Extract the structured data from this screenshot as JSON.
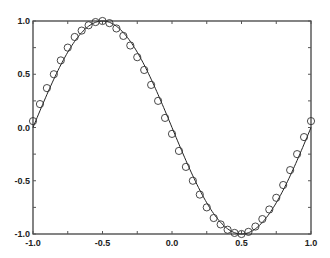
{
  "chart_data": {
    "type": "line",
    "title": "",
    "xlabel": "",
    "ylabel": "",
    "xlim": [
      -1.0,
      1.0
    ],
    "ylim": [
      -1.0,
      1.0
    ],
    "grid": false,
    "legend": null,
    "x_ticks": [
      "-1.0",
      "-0.5",
      "0.0",
      "0.5",
      "1.0"
    ],
    "y_ticks": [
      "1.0",
      "0.5",
      "0.0",
      "-0.5",
      "-1.0"
    ],
    "series": [
      {
        "name": "curve",
        "style": "solid line",
        "function": "y = -sin(pi*x)",
        "x": [
          -1.0,
          -0.9,
          -0.8,
          -0.7,
          -0.6,
          -0.5,
          -0.4,
          -0.3,
          -0.2,
          -0.1,
          0.0,
          0.1,
          0.2,
          0.3,
          0.4,
          0.5,
          0.6,
          0.7,
          0.8,
          0.9,
          1.0
        ],
        "values": [
          0.0,
          0.31,
          0.59,
          0.81,
          0.95,
          1.0,
          0.95,
          0.81,
          0.59,
          0.31,
          0.0,
          -0.31,
          -0.59,
          -0.81,
          -0.95,
          -1.0,
          -0.95,
          -0.81,
          -0.59,
          -0.31,
          0.0
        ]
      },
      {
        "name": "samples",
        "style": "open circles",
        "x": [
          -1.0,
          -0.95,
          -0.9,
          -0.85,
          -0.8,
          -0.75,
          -0.7,
          -0.65,
          -0.6,
          -0.55,
          -0.5,
          -0.45,
          -0.4,
          -0.35,
          -0.3,
          -0.25,
          -0.2,
          -0.15,
          -0.1,
          -0.05,
          0.0,
          0.05,
          0.1,
          0.15,
          0.2,
          0.25,
          0.3,
          0.35,
          0.4,
          0.45,
          0.5,
          0.55,
          0.6,
          0.65,
          0.7,
          0.75,
          0.8,
          0.85,
          0.9,
          0.95,
          1.0
        ],
        "values": [
          0.06,
          0.22,
          0.37,
          0.5,
          0.63,
          0.75,
          0.85,
          0.91,
          0.96,
          0.99,
          1.0,
          0.98,
          0.93,
          0.86,
          0.77,
          0.66,
          0.54,
          0.4,
          0.25,
          0.09,
          -0.06,
          -0.22,
          -0.37,
          -0.5,
          -0.63,
          -0.75,
          -0.85,
          -0.91,
          -0.96,
          -0.99,
          -1.0,
          -0.98,
          -0.93,
          -0.86,
          -0.77,
          -0.66,
          -0.54,
          -0.4,
          -0.25,
          -0.09,
          0.06
        ]
      }
    ]
  }
}
